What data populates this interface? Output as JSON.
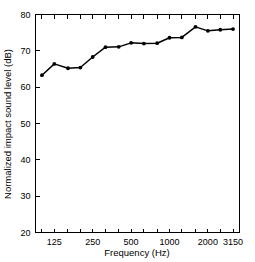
{
  "chart_data": {
    "type": "line",
    "title": "",
    "subtitle": "",
    "xlabel": "Frequency (Hz)",
    "ylabel": "Normalized impact sound level (dB)",
    "x": [
      100,
      125,
      160,
      200,
      250,
      315,
      400,
      500,
      630,
      800,
      1000,
      1250,
      1600,
      2000,
      2500,
      3150
    ],
    "x_tick_labels_shown": [
      "125",
      "250",
      "500",
      "1000",
      "2000",
      "3150"
    ],
    "x_tick_label_values": [
      125,
      250,
      500,
      1000,
      2000,
      3150
    ],
    "x_all_ticks": [
      100,
      125,
      160,
      200,
      250,
      315,
      400,
      500,
      630,
      800,
      1000,
      1250,
      1600,
      2000,
      2500,
      3150
    ],
    "xscale": "log",
    "xlim": [
      89,
      3540
    ],
    "values": [
      63.3,
      66.4,
      65.2,
      65.4,
      68.3,
      71.0,
      71.1,
      72.2,
      72.0,
      72.1,
      73.6,
      73.7,
      76.6,
      75.5,
      75.8,
      76.0
    ],
    "ylim": [
      20,
      80
    ],
    "y_ticks": [
      20,
      30,
      40,
      50,
      60,
      70,
      80
    ],
    "y_tick_labels": [
      "20",
      "30",
      "40",
      "50",
      "60",
      "70",
      "80"
    ],
    "yscale": "linear",
    "grid": false,
    "legend": null,
    "legend_position": "none",
    "marker": "filled-circle",
    "marker_color": "#000000",
    "line_color": "#000000",
    "background_color": "#ffffff",
    "frame": "box",
    "annotations": []
  },
  "axis_titles": {
    "x": "Frequency (Hz)",
    "y": "Normalized impact sound level (dB)"
  }
}
